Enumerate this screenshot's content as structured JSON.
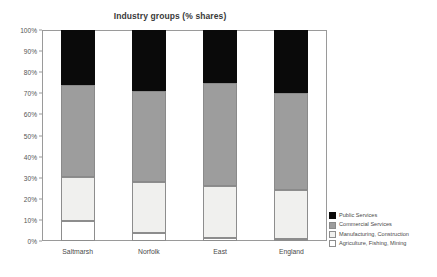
{
  "chart_data": {
    "type": "bar",
    "subtype": "stacked-100-percent",
    "title": "Industry groups (% shares)",
    "xlabel": "",
    "ylabel": "",
    "ylim": [
      0,
      100
    ],
    "grid": false,
    "legend_position": "right",
    "categories": [
      "Saltmarsh",
      "Norfolk",
      "East",
      "England"
    ],
    "ytick_labels": [
      "0%",
      "10%",
      "20%",
      "30%",
      "40%",
      "50%",
      "60%",
      "70%",
      "80%",
      "90%",
      "100%"
    ],
    "ytick_values": [
      0,
      10,
      20,
      30,
      40,
      50,
      60,
      70,
      80,
      90,
      100
    ],
    "series": [
      {
        "name": "Agriculture, Fishing, Mining",
        "color": "#ffffff",
        "values": [
          9.5,
          4.0,
          1.5,
          1.0
        ]
      },
      {
        "name": "Manufacturing, Construction",
        "color": "#f0f0ee",
        "values": [
          21.0,
          24.0,
          24.5,
          23.0
        ]
      },
      {
        "name": "Commercial Services",
        "color": "#9d9d9d",
        "values": [
          43.5,
          43.0,
          49.0,
          46.0
        ]
      },
      {
        "name": "Public Services",
        "color": "#0a0a0a",
        "values": [
          26.0,
          29.0,
          25.0,
          30.0
        ]
      }
    ],
    "legend_order": [
      "Public Services",
      "Commercial Services",
      "Manufacturing, Construction",
      "Agriculture, Fishing, Mining"
    ]
  }
}
